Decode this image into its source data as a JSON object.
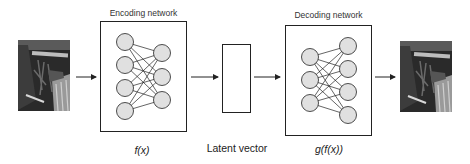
{
  "diagram": {
    "type": "autoencoder",
    "input_image": {
      "description": "grayscale photo of plants",
      "icon": "photo-icon"
    },
    "encoder": {
      "title": "Encoding network",
      "function_label": "f(x)",
      "layers": [
        4,
        3
      ]
    },
    "latent": {
      "label": "Latent vector"
    },
    "decoder": {
      "title": "Decoding network",
      "function_label": "g(f(x))",
      "layers": [
        3,
        4
      ]
    },
    "output_image": {
      "description": "reconstructed grayscale photo of plants",
      "icon": "photo-icon"
    },
    "colors": {
      "node_fill": "#e0e0e0",
      "stroke": "#222222",
      "background": "#ffffff"
    }
  }
}
